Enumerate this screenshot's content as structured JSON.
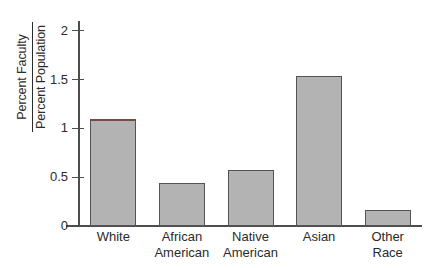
{
  "chart_data": {
    "type": "bar",
    "title": "",
    "subtitle": "",
    "xlabel": "",
    "ylabel_numerator": "Percent Faculty",
    "ylabel_denominator": "Percent Population",
    "categories": [
      "White",
      "African\nAmerican",
      "Native\nAmerican",
      "Asian",
      "Other\nRace"
    ],
    "values": [
      1.1,
      0.44,
      0.57,
      1.54,
      0.16
    ],
    "ylim": [
      0,
      2.1
    ],
    "ytick_values": [
      0,
      0.5,
      1,
      1.5,
      2
    ],
    "ytick_labels": [
      "0",
      "0.5",
      "1",
      "1.5",
      "2"
    ],
    "grid": false,
    "legend": "none",
    "bar_fill_color": "#b3b3b3",
    "bar_border_color": "#545454",
    "bar_cap_color_first": "#7a4a44",
    "axis_color": "#4d4d4d",
    "background_color": "#ffffff"
  }
}
